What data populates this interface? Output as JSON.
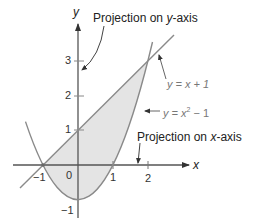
{
  "diagram": {
    "axes": {
      "x_label": "x",
      "y_label": "y",
      "x_ticks": [
        "−1",
        "0",
        "1",
        "2"
      ],
      "y_ticks": [
        "1",
        "2",
        "3",
        "−1"
      ]
    },
    "curves": {
      "line": {
        "label_prefix": "y = x + 1"
      },
      "parabola": {
        "label_prefix": "y = x",
        "label_exp": "2",
        "label_suffix": " − 1"
      }
    },
    "annotations": {
      "proj_y_prefix": "Projection on ",
      "proj_y_var": "y",
      "proj_y_suffix": "-axis",
      "proj_x_prefix": "Projection on ",
      "proj_x_var": "x",
      "proj_x_suffix": "-axis"
    },
    "colors": {
      "fill": "#e4e4e4",
      "curve": "#8a8a8a",
      "axis": "#555555",
      "text": "#222222"
    }
  }
}
